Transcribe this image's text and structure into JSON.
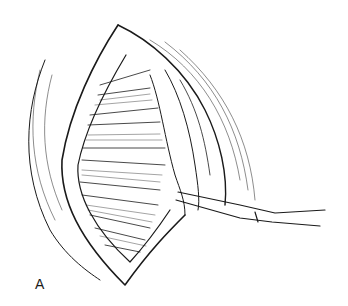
{
  "figure": {
    "panel_label": "A",
    "colors": {
      "ink": "#1a1a1a",
      "background": "#ffffff"
    }
  }
}
